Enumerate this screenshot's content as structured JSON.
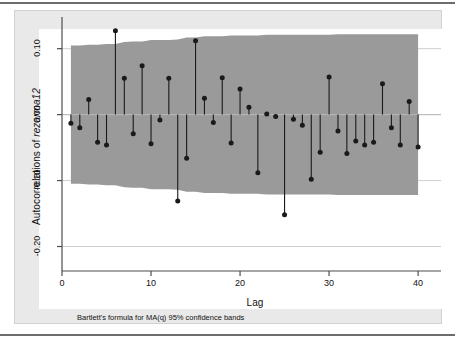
{
  "figure": {
    "background_color": "#e9e9e9",
    "plot_background_color": "#ffffff",
    "band_color": "#9a9a9a",
    "marker_color": "#1a1a1a",
    "axis_color": "#4d4d4d"
  },
  "axes": {
    "ylabel_prefix": "Autocorrelations of ",
    "ylabel_variable": "rezarma12",
    "xlabel": "Lag",
    "ytick_labels": [
      "0.10",
      "0.00",
      "-0.10",
      "-0.20"
    ],
    "xtick_labels": [
      "0",
      "10",
      "20",
      "30",
      "40"
    ]
  },
  "note": {
    "text": "Bartlett's formula for MA(q) 95% confidence bands"
  },
  "chart_data": {
    "type": "bar",
    "title": "",
    "subtitle": "",
    "xlabel": "Lag",
    "ylabel": "Autocorrelations of rezarma12",
    "annotations": [
      "Bartlett's formula for MA(q) 95% confidence bands"
    ],
    "legend": [],
    "legend_position": "none",
    "grid": true,
    "xlim": [
      0,
      41
    ],
    "ylim": [
      -0.225,
      0.145
    ],
    "xticks": [
      0,
      10,
      20,
      30,
      40
    ],
    "yticks": [
      0.1,
      0.0,
      -0.1,
      -0.2
    ],
    "categories": [
      1,
      2,
      3,
      4,
      5,
      6,
      7,
      8,
      9,
      10,
      11,
      12,
      13,
      14,
      15,
      16,
      17,
      18,
      19,
      20,
      21,
      22,
      23,
      24,
      25,
      26,
      27,
      28,
      29,
      30,
      31,
      32,
      33,
      34,
      35,
      36,
      37,
      38,
      39,
      40
    ],
    "values": [
      -0.013,
      -0.02,
      0.023,
      -0.042,
      -0.046,
      0.127,
      0.055,
      -0.029,
      0.074,
      -0.044,
      -0.008,
      0.055,
      -0.131,
      -0.066,
      0.112,
      0.025,
      -0.012,
      0.056,
      -0.043,
      0.039,
      0.011,
      -0.088,
      0.001,
      -0.003,
      -0.152,
      -0.007,
      -0.016,
      -0.098,
      -0.057,
      0.057,
      -0.025,
      -0.059,
      -0.04,
      -0.046,
      -0.042,
      0.047,
      -0.02,
      -0.046,
      0.02,
      -0.049
    ],
    "confidence_band": {
      "label": "Bartlett's formula for MA(q) 95% confidence bands",
      "upper": [
        0.105,
        0.105,
        0.106,
        0.106,
        0.107,
        0.107,
        0.11,
        0.111,
        0.111,
        0.113,
        0.113,
        0.113,
        0.114,
        0.117,
        0.117,
        0.119,
        0.119,
        0.119,
        0.12,
        0.12,
        0.12,
        0.12,
        0.121,
        0.121,
        0.121,
        0.121,
        0.121,
        0.121,
        0.121,
        0.121,
        0.122,
        0.122,
        0.122,
        0.122,
        0.122,
        0.122,
        0.122,
        0.122,
        0.122,
        0.122
      ],
      "lower": [
        -0.105,
        -0.105,
        -0.106,
        -0.106,
        -0.107,
        -0.107,
        -0.11,
        -0.111,
        -0.111,
        -0.113,
        -0.113,
        -0.113,
        -0.114,
        -0.117,
        -0.117,
        -0.119,
        -0.119,
        -0.119,
        -0.12,
        -0.12,
        -0.12,
        -0.12,
        -0.121,
        -0.121,
        -0.121,
        -0.121,
        -0.121,
        -0.121,
        -0.121,
        -0.121,
        -0.122,
        -0.122,
        -0.122,
        -0.122,
        -0.122,
        -0.122,
        -0.122,
        -0.122,
        -0.122,
        -0.122
      ]
    }
  }
}
